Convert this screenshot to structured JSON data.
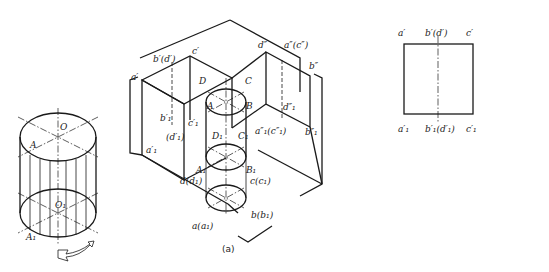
{
  "figure": {
    "left_drawing": {
      "labels": {
        "top_center": "O",
        "top_point": "A",
        "bottom_center": "O₁",
        "bottom_point": "A₁"
      },
      "rotation_arrow": "rotation-arrow"
    },
    "panel_a": {
      "caption": "(a)",
      "labels": {
        "a_prime": "a′",
        "b_prime_d_prime": "b′(d′)",
        "c_prime": "c′",
        "d_dprime": "d″",
        "a_dprime_c_dprime": "a″(c″)",
        "b_dprime": "b″",
        "D": "D",
        "C": "C",
        "A": "A",
        "B": "B",
        "b1_prime": "b′₁",
        "c1_prime": "c′₁",
        "d1_prime": "(d′₁)",
        "a1_prime": "a′₁",
        "D1": "D₁",
        "C1": "C₁",
        "A1": "A₁",
        "B1": "B₁",
        "d1_dprime": "d″₁",
        "a1_dprime_c1_dprime": "a″₁(c″₁)",
        "b1_dprime": "b″₁",
        "d_d1": "d(d₁)",
        "c_c1": "c(c₁)",
        "a_a1": "a(a₁)",
        "b_b1": "b(b₁)"
      }
    },
    "panel_b": {
      "caption": "(b)",
      "front_view": {
        "top_labels": [
          "a′",
          "b′(d′)",
          "c′"
        ],
        "bottom_labels": [
          "a′₁",
          "b′₁(d′₁)",
          "c′₁"
        ]
      },
      "side_view": {
        "top_labels": [
          "d″",
          "a″(c″)",
          "b″"
        ],
        "bottom_labels": [
          "d″₁",
          "a″₁(c″₁)",
          "b″₁"
        ]
      },
      "top_view": {
        "labels": {
          "top": "d(d₁)",
          "left": "a(a₁)",
          "right": "c(c₁)",
          "bottom": "b(b₁)"
        }
      }
    },
    "bottom_caption_faint": "图 3-16  圆柱的三视图"
  }
}
